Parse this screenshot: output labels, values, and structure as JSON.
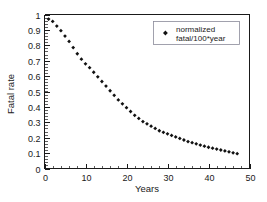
{
  "chart_data": {
    "type": "scatter",
    "title": "",
    "xlabel": "Years",
    "ylabel": "Fatal rate",
    "xlim": [
      0,
      50
    ],
    "ylim": [
      0,
      1
    ],
    "grid": false,
    "legend_position": "top-right",
    "x_ticks": [
      "0",
      "10",
      "20",
      "30",
      "40",
      "50"
    ],
    "x_tick_values": [
      0,
      10,
      20,
      30,
      40,
      50
    ],
    "x_minor_step": 2,
    "y_ticks": [
      "0",
      "0.1",
      "0.2",
      "0.3",
      "0.4",
      "0.5",
      "0.6",
      "0.7",
      "0.8",
      "0.9",
      "1"
    ],
    "y_tick_values": [
      0,
      0.1,
      0.2,
      0.3,
      0.4,
      0.5,
      0.6,
      0.7,
      0.8,
      0.9,
      1
    ],
    "y_minor_step": 0.02,
    "marker": "diamond",
    "marker_color": "#111111",
    "series": [
      {
        "name": "normalized fatal/100*year",
        "x": [
          1,
          2,
          3,
          4,
          5,
          6,
          7,
          8,
          9,
          10,
          11,
          12,
          13,
          14,
          15,
          16,
          17,
          18,
          19,
          20,
          21,
          22,
          23,
          24,
          25,
          26,
          27,
          28,
          29,
          30,
          31,
          32,
          33,
          34,
          35,
          36,
          37,
          38,
          39,
          40,
          41,
          42,
          43,
          44,
          45,
          46,
          47
        ],
        "y": [
          0.97,
          0.955,
          0.925,
          0.895,
          0.86,
          0.825,
          0.785,
          0.745,
          0.71,
          0.68,
          0.655,
          0.625,
          0.595,
          0.565,
          0.535,
          0.505,
          0.475,
          0.445,
          0.42,
          0.395,
          0.37,
          0.345,
          0.325,
          0.305,
          0.29,
          0.275,
          0.26,
          0.245,
          0.235,
          0.225,
          0.215,
          0.205,
          0.195,
          0.185,
          0.175,
          0.168,
          0.16,
          0.152,
          0.145,
          0.138,
          0.132,
          0.126,
          0.12,
          0.114,
          0.108,
          0.102,
          0.096
        ]
      }
    ]
  },
  "legend": {
    "line1": "normalized",
    "line2": "fatal/100*year"
  },
  "axes": {
    "xlabel": "Years",
    "ylabel": "Fatal rate"
  }
}
